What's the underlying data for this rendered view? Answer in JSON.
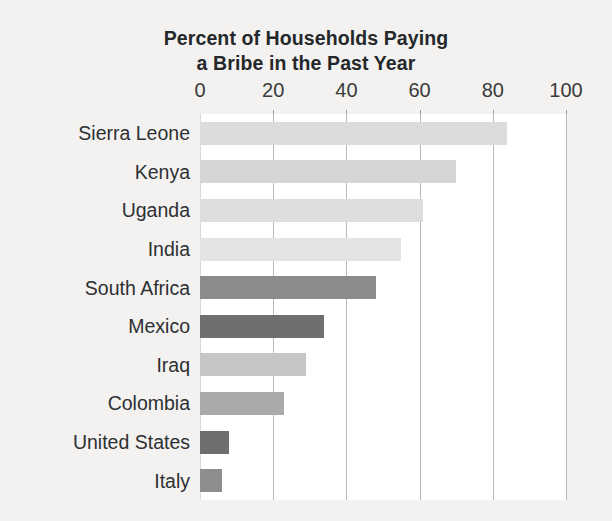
{
  "chart_data": {
    "type": "bar",
    "orientation": "horizontal",
    "title": "Percent of Households Paying a Bribe in the Past Year",
    "title_lines": [
      "Percent of Households Paying",
      "a Bribe in the Past Year"
    ],
    "xlabel": "",
    "ylabel": "",
    "xlim": [
      0,
      100
    ],
    "grid": true,
    "legend": "none",
    "tick_labels": [
      "0",
      "20",
      "40",
      "60",
      "80",
      "100"
    ],
    "tick_values": [
      0,
      20,
      40,
      60,
      80,
      100
    ],
    "categories": [
      "Sierra Leone",
      "Kenya",
      "Uganda",
      "India",
      "South Africa",
      "Mexico",
      "Iraq",
      "Colombia",
      "United States",
      "Italy"
    ],
    "values": [
      84,
      70,
      61,
      55,
      48,
      34,
      29,
      23,
      8,
      6
    ],
    "bar_colors": [
      "#dcdcdc",
      "#d5d5d5",
      "#dddddd",
      "#e4e4e4",
      "#8b8b8b",
      "#6f6f6f",
      "#c6c6c6",
      "#aaaaaa",
      "#6e6e6e",
      "#8e8e8e"
    ],
    "bars": [
      {
        "label": "Sierra Leone",
        "value": 84,
        "color": "#dcdcdc"
      },
      {
        "label": "Kenya",
        "value": 70,
        "color": "#d5d5d5"
      },
      {
        "label": "Uganda",
        "value": 61,
        "color": "#dddddd"
      },
      {
        "label": "India",
        "value": 55,
        "color": "#e4e4e4"
      },
      {
        "label": "South Africa",
        "value": 48,
        "color": "#8b8b8b"
      },
      {
        "label": "Mexico",
        "value": 34,
        "color": "#6f6f6f"
      },
      {
        "label": "Iraq",
        "value": 29,
        "color": "#c6c6c6"
      },
      {
        "label": "Colombia",
        "value": 23,
        "color": "#aaaaaa"
      },
      {
        "label": "United States",
        "value": 8,
        "color": "#6e6e6e"
      },
      {
        "label": "Italy",
        "value": 6,
        "color": "#8e8e8e"
      }
    ]
  },
  "style": {
    "background": "#f3f2f0",
    "plot_background": "#ffffff",
    "gridline_color": "#b9b9b9",
    "text_color": "#2d3033"
  }
}
